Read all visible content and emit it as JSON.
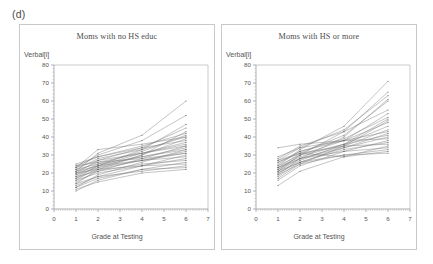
{
  "figure": {
    "label": "(d)"
  },
  "panels": [
    {
      "id": "no-hs",
      "title": "Moms with no HS educ",
      "ylabel": "Verbal[i]",
      "xlabel": "Grade at Testing"
    },
    {
      "id": "hs-or-more",
      "title": "Moms with HS or more",
      "ylabel": "Verbal[i]",
      "xlabel": "Grade at Testing"
    }
  ],
  "chart_data": [
    {
      "type": "line",
      "title": "Moms with no HS educ",
      "xlabel": "Grade at Testing",
      "ylabel": "Verbal[i]",
      "xlim": [
        0,
        7
      ],
      "ylim": [
        0,
        80
      ],
      "xticks": [
        0,
        1,
        2,
        3,
        4,
        5,
        6,
        7
      ],
      "yticks": [
        0,
        10,
        20,
        30,
        40,
        50,
        60,
        70,
        80
      ],
      "grid": false,
      "legend": "none",
      "x": [
        1,
        2,
        4,
        6
      ],
      "series": [
        {
          "name": "child-1",
          "values": [
            21,
            31,
            41,
            60
          ]
        },
        {
          "name": "child-2",
          "values": [
            23,
            30,
            38,
            52
          ]
        },
        {
          "name": "child-3",
          "values": [
            17,
            24,
            33,
            47
          ]
        },
        {
          "name": "child-4",
          "values": [
            20,
            27,
            34,
            45
          ]
        },
        {
          "name": "child-5",
          "values": [
            14,
            22,
            30,
            43
          ]
        },
        {
          "name": "child-6",
          "values": [
            24,
            29,
            35,
            42
          ]
        },
        {
          "name": "child-7",
          "values": [
            19,
            25,
            32,
            41
          ]
        },
        {
          "name": "child-8",
          "values": [
            22,
            28,
            33,
            40
          ]
        },
        {
          "name": "child-9",
          "values": [
            16,
            23,
            30,
            39
          ]
        },
        {
          "name": "child-10",
          "values": [
            25,
            29,
            34,
            38
          ]
        },
        {
          "name": "child-11",
          "values": [
            18,
            24,
            31,
            37
          ]
        },
        {
          "name": "child-12",
          "values": [
            21,
            26,
            31,
            36
          ]
        },
        {
          "name": "child-13",
          "values": [
            15,
            21,
            28,
            35
          ]
        },
        {
          "name": "child-14",
          "values": [
            23,
            27,
            31,
            35
          ]
        },
        {
          "name": "child-15",
          "values": [
            20,
            24,
            29,
            34
          ]
        },
        {
          "name": "child-16",
          "values": [
            12,
            19,
            26,
            33
          ]
        },
        {
          "name": "child-17",
          "values": [
            22,
            25,
            29,
            33
          ]
        },
        {
          "name": "child-18",
          "values": [
            17,
            22,
            27,
            32
          ]
        },
        {
          "name": "child-19",
          "values": [
            19,
            23,
            27,
            31
          ]
        },
        {
          "name": "child-20",
          "values": [
            13,
            18,
            24,
            30
          ]
        },
        {
          "name": "child-21",
          "values": [
            21,
            24,
            27,
            29
          ]
        },
        {
          "name": "child-22",
          "values": [
            16,
            20,
            24,
            28
          ]
        },
        {
          "name": "child-23",
          "values": [
            18,
            21,
            25,
            27
          ]
        },
        {
          "name": "child-24",
          "values": [
            10,
            16,
            22,
            26
          ]
        },
        {
          "name": "child-25",
          "values": [
            20,
            22,
            24,
            25
          ]
        },
        {
          "name": "child-26",
          "values": [
            14,
            18,
            21,
            24
          ]
        },
        {
          "name": "child-27",
          "values": [
            23,
            33,
            36,
            40
          ]
        },
        {
          "name": "child-28",
          "values": [
            12,
            17,
            22,
            23
          ]
        },
        {
          "name": "child-29",
          "values": [
            24,
            26,
            28,
            31
          ]
        },
        {
          "name": "child-30",
          "values": [
            11,
            15,
            20,
            22
          ]
        }
      ]
    },
    {
      "type": "line",
      "title": "Moms with HS or more",
      "xlabel": "Grade at Testing",
      "ylabel": "Verbal[i]",
      "xlim": [
        0,
        7
      ],
      "ylim": [
        0,
        80
      ],
      "xticks": [
        0,
        1,
        2,
        3,
        4,
        5,
        6,
        7
      ],
      "yticks": [
        0,
        10,
        20,
        30,
        40,
        50,
        60,
        70,
        80
      ],
      "grid": false,
      "legend": "none",
      "x": [
        1,
        2,
        4,
        6
      ],
      "series": [
        {
          "name": "child-1",
          "values": [
            24,
            33,
            46,
            71
          ]
        },
        {
          "name": "child-2",
          "values": [
            21,
            30,
            43,
            65
          ]
        },
        {
          "name": "child-3",
          "values": [
            27,
            34,
            44,
            63
          ]
        },
        {
          "name": "child-4",
          "values": [
            19,
            28,
            40,
            61
          ]
        },
        {
          "name": "child-5",
          "values": [
            23,
            31,
            41,
            60
          ]
        },
        {
          "name": "child-6",
          "values": [
            28,
            35,
            43,
            55
          ]
        },
        {
          "name": "child-7",
          "values": [
            22,
            30,
            38,
            53
          ]
        },
        {
          "name": "child-8",
          "values": [
            25,
            32,
            39,
            51
          ]
        },
        {
          "name": "child-9",
          "values": [
            20,
            27,
            36,
            50
          ]
        },
        {
          "name": "child-10",
          "values": [
            17,
            25,
            35,
            49
          ]
        },
        {
          "name": "child-11",
          "values": [
            26,
            32,
            38,
            48
          ]
        },
        {
          "name": "child-12",
          "values": [
            23,
            29,
            36,
            46
          ]
        },
        {
          "name": "child-13",
          "values": [
            21,
            28,
            35,
            44
          ]
        },
        {
          "name": "child-14",
          "values": [
            29,
            34,
            38,
            43
          ]
        },
        {
          "name": "child-15",
          "values": [
            18,
            26,
            34,
            42
          ]
        },
        {
          "name": "child-16",
          "values": [
            24,
            30,
            36,
            41
          ]
        },
        {
          "name": "child-17",
          "values": [
            22,
            28,
            34,
            40
          ]
        },
        {
          "name": "child-18",
          "values": [
            34,
            36,
            38,
            39
          ]
        },
        {
          "name": "child-19",
          "values": [
            16,
            24,
            32,
            38
          ]
        },
        {
          "name": "child-20",
          "values": [
            20,
            26,
            33,
            37
          ]
        },
        {
          "name": "child-21",
          "values": [
            26,
            31,
            35,
            36
          ]
        },
        {
          "name": "child-22",
          "values": [
            13,
            21,
            29,
            35
          ]
        },
        {
          "name": "child-23",
          "values": [
            23,
            28,
            32,
            34
          ]
        },
        {
          "name": "child-24",
          "values": [
            19,
            25,
            30,
            33
          ]
        },
        {
          "name": "child-25",
          "values": [
            27,
            31,
            29,
            32
          ]
        },
        {
          "name": "child-26",
          "values": [
            21,
            26,
            30,
            31
          ]
        }
      ]
    }
  ]
}
